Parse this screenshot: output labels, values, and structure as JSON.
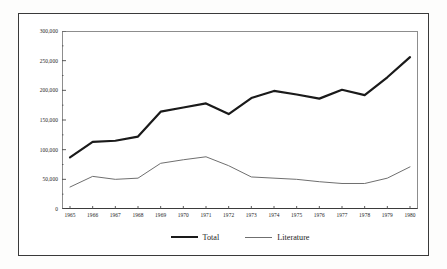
{
  "chart_data": {
    "type": "line",
    "title": "",
    "subtitle": "",
    "xlabel": "",
    "ylabel": "",
    "grid": false,
    "legend_position": "bottom-center",
    "categories": [
      "1965",
      "1966",
      "1967",
      "1968",
      "1969",
      "1970",
      "1971",
      "1972",
      "1973",
      "1974",
      "1975",
      "1976",
      "1977",
      "1978",
      "1979",
      "1980"
    ],
    "x": [
      1965,
      1966,
      1967,
      1968,
      1969,
      1970,
      1971,
      1972,
      1973,
      1974,
      1975,
      1976,
      1977,
      1978,
      1979,
      1980
    ],
    "xlim": [
      1965,
      1980
    ],
    "ylim": [
      0,
      300000
    ],
    "ytick_values": [
      0,
      50000,
      100000,
      150000,
      200000,
      250000,
      300000
    ],
    "ytick_labels": [
      "0",
      "50,000",
      "100,000",
      "150,000",
      "200,000",
      "250,000",
      "300,000"
    ],
    "yminor_values": [
      25000,
      75000,
      125000,
      175000,
      225000,
      275000
    ],
    "series": [
      {
        "name": "Total",
        "color": "#1a1a1a",
        "width": 2.2,
        "values": [
          87000,
          113000,
          115000,
          122000,
          164000,
          171000,
          178000,
          160000,
          187000,
          199000,
          193000,
          186000,
          201000,
          192000,
          222000,
          256000
        ]
      },
      {
        "name": "Literature",
        "color": "#6f6f6f",
        "width": 1.0,
        "values": [
          37000,
          55000,
          50000,
          52000,
          77000,
          83000,
          88000,
          73000,
          54000,
          52000,
          50000,
          46000,
          43000,
          43000,
          52000,
          71000
        ]
      }
    ],
    "legend": [
      {
        "label": "Total",
        "swatch": "thick-line"
      },
      {
        "label": "Literature",
        "swatch": "thin-line"
      }
    ]
  },
  "colors": {
    "frame": "#3a3a3a",
    "axis": "#3b3b3b",
    "plot_border": "#8d8d8d",
    "total_line": "#1a1a1a",
    "literature_line": "#6f6f6f",
    "text": "#1d1d1d",
    "background": "#ffffff"
  }
}
